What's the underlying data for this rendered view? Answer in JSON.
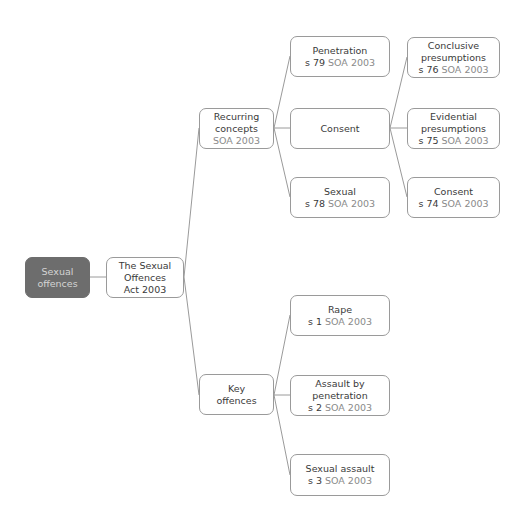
{
  "diagram": {
    "colors": {
      "root_fill": "#6d6d6d",
      "root_text": "#d4d4d4",
      "node_border": "#9a9a9a",
      "text": "#3a3a3a",
      "act_reference": "#8a8a8a",
      "connector": "#9a9a9a"
    },
    "root": {
      "lines": [
        "Sexual",
        "offences"
      ]
    },
    "act": {
      "lines": [
        "The Sexual",
        "Offences",
        "Act 2003"
      ]
    },
    "recurring_concepts": {
      "lines": [
        "Recurring",
        "concepts"
      ],
      "ref_act": "SOA 2003"
    },
    "key_offences": {
      "lines": [
        "Key",
        "offences"
      ]
    },
    "penetration": {
      "title": "Penetration",
      "ref_section": "s 79",
      "ref_act": "SOA 2003"
    },
    "consent_concept": {
      "title": "Consent"
    },
    "sexual": {
      "title": "Sexual",
      "ref_section": "s 78",
      "ref_act": "SOA 2003"
    },
    "conclusive_presumptions": {
      "lines": [
        "Conclusive",
        "presumptions"
      ],
      "ref_section": "s 76",
      "ref_act": "SOA 2003"
    },
    "evidential_presumptions": {
      "lines": [
        "Evidential",
        "presumptions"
      ],
      "ref_section": "s 75",
      "ref_act": "SOA 2003"
    },
    "consent_definition": {
      "title": "Consent",
      "ref_section": "s 74",
      "ref_act": "SOA 2003"
    },
    "rape": {
      "title": "Rape",
      "ref_section": "s 1",
      "ref_act": "SOA 2003"
    },
    "assault_by_penetration": {
      "lines": [
        "Assault by",
        "penetration"
      ],
      "ref_section": "s 2",
      "ref_act": "SOA 2003"
    },
    "sexual_assault": {
      "title": "Sexual assault",
      "ref_section": "s 3",
      "ref_act": "SOA 2003"
    }
  }
}
